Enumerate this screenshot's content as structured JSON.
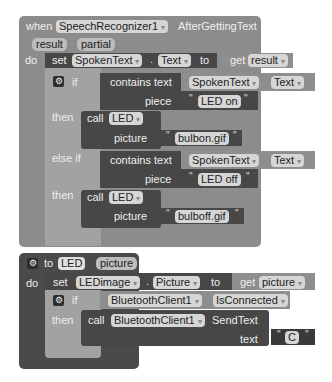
{
  "event_block": {
    "keyword_when": "when",
    "component": "SpeechRecognizer1",
    "event": "AfterGettingText",
    "params": [
      "result",
      "partial"
    ],
    "keyword_do": "do",
    "set_stmt": {
      "keyword_set": "set",
      "component": "SpokenText",
      "property": "Text",
      "keyword_to": "to",
      "keyword_get": "get",
      "variable": "result"
    },
    "if_block": {
      "keyword_if": "if",
      "keyword_then": "then",
      "keyword_else_if": "else if",
      "cond1": {
        "label": "contains text",
        "component": "SpokenText",
        "property": "Text",
        "piece_label": "piece",
        "piece_value": "LED on"
      },
      "then1": {
        "keyword_call": "call",
        "procedure": "LED",
        "arg_label": "picture",
        "arg_value": "bulbon.gif"
      },
      "cond2": {
        "label": "contains text",
        "component": "SpokenText",
        "property": "Text",
        "piece_label": "piece",
        "piece_value": "LED off"
      },
      "then2": {
        "keyword_call": "call",
        "procedure": "LED",
        "arg_label": "picture",
        "arg_value": "bulboff.gif"
      }
    }
  },
  "procedure_block": {
    "keyword_to": "to",
    "name": "LED",
    "param": "picture",
    "keyword_do": "do",
    "set_stmt": {
      "keyword_set": "set",
      "component": "LEDimage",
      "property": "Picture",
      "keyword_to": "to",
      "keyword_get": "get",
      "variable": "picture"
    },
    "if_block": {
      "keyword_if": "if",
      "keyword_then": "then",
      "cond": {
        "component": "BluetoothClient1",
        "property": "IsConnected"
      },
      "call": {
        "keyword_call": "call",
        "component": "BluetoothClient1",
        "method": "SendText",
        "arg_label": "text",
        "arg_value": "C"
      }
    }
  },
  "icons": {
    "dropdown": "▾",
    "gear": "⚙",
    "quote": "\"",
    "dot": "."
  }
}
